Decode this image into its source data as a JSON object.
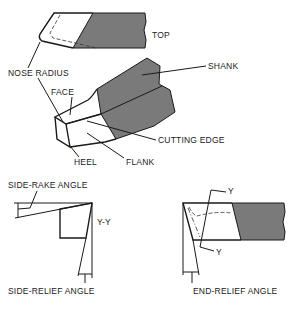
{
  "diagram": {
    "colors": {
      "shank_fill": "#7a7a7a",
      "line": "#1a1a1a",
      "background": "#ffffff"
    },
    "views": {
      "top": {
        "label": "TOP"
      },
      "isometric": {
        "labels": {
          "nose_radius": "NOSE RADIUS",
          "face": "FACE",
          "shank": "SHANK",
          "cutting_edge": "CUTTING EDGE",
          "heel": "HEEL",
          "flank": "FLANK"
        }
      },
      "section_yy": {
        "labels": {
          "side_rake_angle": "SIDE-RAKE ANGLE",
          "section": "Y-Y",
          "side_relief_angle": "SIDE-RELIEF ANGLE"
        }
      },
      "side_view": {
        "labels": {
          "y_top": "Y",
          "y_bottom": "Y",
          "end_relief_angle": "END-RELIEF ANGLE"
        }
      }
    }
  }
}
